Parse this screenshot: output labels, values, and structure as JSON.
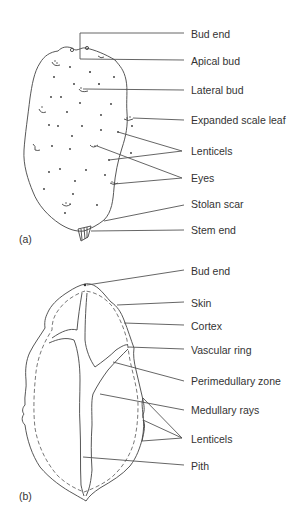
{
  "figure_a": {
    "panel_label": "(a)",
    "labels": [
      {
        "id": "bud-end",
        "text": "Bud end"
      },
      {
        "id": "apical-bud",
        "text": "Apical bud"
      },
      {
        "id": "lateral-bud",
        "text": "Lateral bud"
      },
      {
        "id": "expanded-scale-leaf",
        "text": "Expanded scale leaf"
      },
      {
        "id": "lenticels",
        "text": "Lenticels"
      },
      {
        "id": "eyes",
        "text": "Eyes"
      },
      {
        "id": "stolan-scar",
        "text": "Stolan scar"
      },
      {
        "id": "stem-end",
        "text": "Stem end"
      }
    ]
  },
  "figure_b": {
    "panel_label": "(b)",
    "labels": [
      {
        "id": "bud-end",
        "text": "Bud end"
      },
      {
        "id": "skin",
        "text": "Skin"
      },
      {
        "id": "cortex",
        "text": "Cortex"
      },
      {
        "id": "vascular-ring",
        "text": "Vascular ring"
      },
      {
        "id": "perimedullary-zone",
        "text": "Perimedullary zone"
      },
      {
        "id": "medullary-rays",
        "text": "Medullary rays"
      },
      {
        "id": "lenticels",
        "text": "Lenticels"
      },
      {
        "id": "pith",
        "text": "Pith"
      }
    ]
  }
}
